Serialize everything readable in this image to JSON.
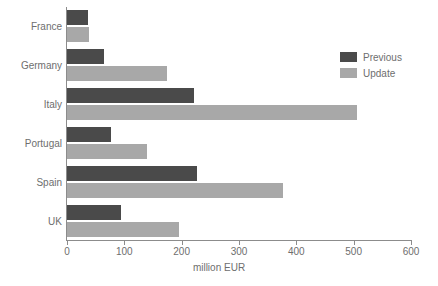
{
  "chart_data": {
    "type": "bar",
    "orientation": "horizontal",
    "title": "",
    "xlabel": "million EUR",
    "ylabel": "",
    "xlim": [
      0,
      600
    ],
    "xticks": [
      0,
      100,
      200,
      300,
      400,
      500,
      600
    ],
    "xtick_labels": [
      "0",
      "100",
      "200",
      "300",
      "400",
      "500",
      "600"
    ],
    "grid": false,
    "legend_position": "upper right",
    "categories": [
      "France",
      "Germany",
      "Italy",
      "Portugal",
      "Spain",
      "UK"
    ],
    "series": [
      {
        "name": "Previous",
        "color": "#4a4a4a",
        "values": [
          37,
          65,
          222,
          76,
          227,
          94
        ]
      },
      {
        "name": "Update",
        "color": "#a8a8a8",
        "values": [
          39,
          174,
          505,
          140,
          377,
          196
        ]
      }
    ]
  },
  "legend": {
    "items": [
      {
        "label": "Previous",
        "swatch": "legend-swatch-previous"
      },
      {
        "label": "Update",
        "swatch": "legend-swatch-update"
      }
    ]
  },
  "colors": {
    "previous": "#4a4a4a",
    "update": "#a8a8a8",
    "axis": "#8c8c8c",
    "text": "#6e6e6e",
    "background": "#ffffff"
  }
}
